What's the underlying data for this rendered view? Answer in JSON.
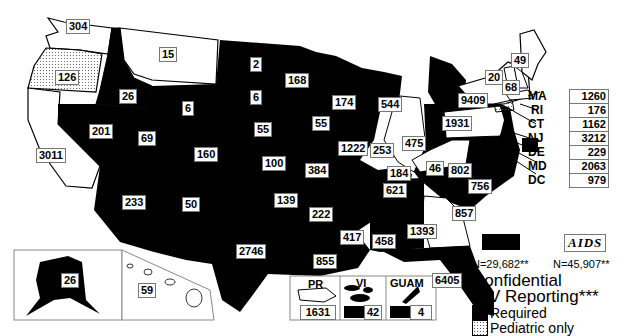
{
  "map": {
    "type": "choropleth",
    "region": "United States and territories",
    "states": {
      "WA": {
        "value": "304",
        "reporting": "none"
      },
      "OR": {
        "value": "126",
        "reporting": "pediatric_only"
      },
      "CA": {
        "value": "3011",
        "reporting": "none"
      },
      "ID": {
        "value": "26",
        "reporting": "required"
      },
      "NV": {
        "value": "201",
        "reporting": "required"
      },
      "MT": {
        "value": "15",
        "reporting": "none"
      },
      "WY": {
        "value": "6",
        "reporting": "required"
      },
      "UT": {
        "value": "69",
        "reporting": "required"
      },
      "AZ": {
        "value": "233",
        "reporting": "required"
      },
      "CO": {
        "value": "160",
        "reporting": "required"
      },
      "NM": {
        "value": "50",
        "reporting": "required"
      },
      "ND": {
        "value": "2",
        "reporting": "required"
      },
      "SD": {
        "value": "6",
        "reporting": "required"
      },
      "NE": {
        "value": "55",
        "reporting": "required"
      },
      "KS": {
        "value": "100",
        "reporting": "required"
      },
      "OK": {
        "value": "139",
        "reporting": "required"
      },
      "TX": {
        "value": "2746",
        "reporting": "required"
      },
      "MN": {
        "value": "168",
        "reporting": "required"
      },
      "IA": {
        "value": "55",
        "reporting": "required"
      },
      "MO": {
        "value": "384",
        "reporting": "required"
      },
      "AR": {
        "value": "222",
        "reporting": "required"
      },
      "LA": {
        "value": "855",
        "reporting": "required"
      },
      "WI": {
        "value": "174",
        "reporting": "required"
      },
      "IL": {
        "value": "1222",
        "reporting": "none"
      },
      "MI": {
        "value": "544",
        "reporting": "required"
      },
      "IN": {
        "value": "253",
        "reporting": "required"
      },
      "OH": {
        "value": "475",
        "reporting": "required"
      },
      "KY": {
        "value": "184",
        "reporting": "none"
      },
      "TN": {
        "value": "621",
        "reporting": "required"
      },
      "MS": {
        "value": "417",
        "reporting": "required"
      },
      "AL": {
        "value": "458",
        "reporting": "required"
      },
      "GA": {
        "value": "1393",
        "reporting": "none"
      },
      "FL": {
        "value": "6405",
        "reporting": "required"
      },
      "SC": {
        "value": "857",
        "reporting": "required"
      },
      "NC": {
        "value": "756",
        "reporting": "required"
      },
      "VA": {
        "value": "802",
        "reporting": "required"
      },
      "WV": {
        "value": "46",
        "reporting": "required"
      },
      "PA": {
        "value": "1931",
        "reporting": "none"
      },
      "NY": {
        "value": "9409",
        "reporting": "none"
      },
      "VT": {
        "value": "20",
        "reporting": "none"
      },
      "NH": {
        "value": "68",
        "reporting": "none"
      },
      "ME": {
        "value": "49",
        "reporting": "none"
      },
      "AK": {
        "value": "26",
        "reporting": "required"
      },
      "HI": {
        "value": "59",
        "reporting": "none"
      }
    },
    "side_list": [
      {
        "abbr": "MA",
        "value": "1260",
        "reporting": "none"
      },
      {
        "abbr": "RI",
        "value": "176",
        "reporting": "none"
      },
      {
        "abbr": "CT",
        "value": "1162",
        "reporting": "pediatric_only"
      },
      {
        "abbr": "NJ",
        "value": "3212",
        "reporting": "required"
      },
      {
        "abbr": "DE",
        "value": "229",
        "reporting": "required"
      },
      {
        "abbr": "MD",
        "value": "2063",
        "reporting": "none"
      },
      {
        "abbr": "DC",
        "value": "979",
        "reporting": "none"
      }
    ],
    "territories": [
      {
        "label": "PR",
        "value": "1631",
        "reporting": "none"
      },
      {
        "label": "VI",
        "value": "42",
        "reporting": "required"
      },
      {
        "label": "GUAM",
        "value": "4",
        "reporting": "required"
      }
    ]
  },
  "legend": {
    "hiv_n": "N=29,682**",
    "aids_label": "AIDS",
    "aids_n": "N=45,907**",
    "title_line1": "Confidential",
    "title_line2": "HIV Reporting***",
    "items": [
      {
        "label": "Required",
        "color": "#000000"
      },
      {
        "label": "Pediatric only",
        "color": "dotted"
      }
    ]
  },
  "colors": {
    "required": "#000000",
    "none": "#ffffff",
    "border": "#000000"
  }
}
